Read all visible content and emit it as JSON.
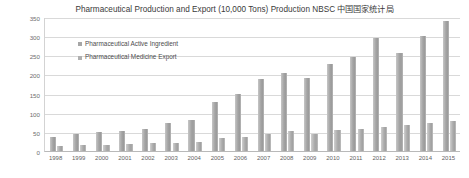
{
  "chart_data": {
    "type": "bar",
    "title": "Pharmaceutical Production and Export (10,000 Tons) Production NBSC  中国国家统计局",
    "xlabel": "",
    "ylabel": "",
    "ylim": [
      0,
      350
    ],
    "yticks": [
      0,
      50,
      100,
      150,
      200,
      250,
      300,
      350
    ],
    "grid": true,
    "legend_position": "inside-top-left",
    "categories": [
      "1998",
      "1999",
      "2000",
      "2001",
      "2002",
      "2003",
      "2004",
      "2005",
      "2006",
      "2007",
      "2008",
      "2009",
      "2010",
      "2011",
      "2012",
      "2013",
      "2014",
      "2015"
    ],
    "series": [
      {
        "name": "Pharmaceutical Active Ingredient",
        "color": "#a6a6a6",
        "values": [
          37,
          44,
          49,
          53,
          58,
          74,
          80,
          128,
          150,
          188,
          205,
          192,
          227,
          245,
          295,
          255,
          300,
          340
        ]
      },
      {
        "name": "Pharmaceutical Medicine Export",
        "color": "#b0b0b0",
        "values": [
          14,
          16,
          17,
          18,
          20,
          22,
          24,
          33,
          37,
          44,
          52,
          44,
          55,
          58,
          63,
          68,
          72,
          78
        ]
      }
    ]
  },
  "legend": {
    "items": [
      {
        "label": "Pharmaceutical Active Ingredient"
      },
      {
        "label": "Pharmaceutical Medicine Export"
      }
    ]
  }
}
